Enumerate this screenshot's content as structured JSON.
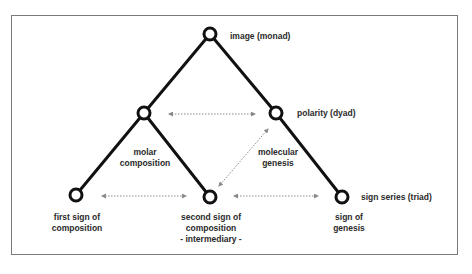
{
  "diagram": {
    "type": "tree",
    "nodes": [
      {
        "id": "image",
        "label": "image (monad)",
        "x": 210,
        "y": 34
      },
      {
        "id": "left_mid",
        "label": "",
        "x": 144,
        "y": 113
      },
      {
        "id": "polarity",
        "label": "polarity (dyad)",
        "x": 276,
        "y": 113
      },
      {
        "id": "first_sign",
        "label": "first sign of composition",
        "x": 76,
        "y": 195
      },
      {
        "id": "second_sign",
        "label": "second sign of composition - intermediary -",
        "x": 210,
        "y": 197
      },
      {
        "id": "sign_of_genesis",
        "label": "sign of genesis",
        "x": 342,
        "y": 197
      }
    ],
    "edges": [
      {
        "from": "image",
        "to": "left_mid"
      },
      {
        "from": "image",
        "to": "polarity"
      },
      {
        "from": "left_mid",
        "to": "first_sign"
      },
      {
        "from": "left_mid",
        "to": "second_sign"
      },
      {
        "from": "polarity",
        "to": "sign_of_genesis"
      }
    ],
    "relations": [
      {
        "from": "left_mid",
        "to": "polarity",
        "style": "dotted-double-arrow"
      },
      {
        "from": "first_sign",
        "to": "second_sign",
        "style": "dotted-double-arrow"
      },
      {
        "from": "second_sign",
        "to": "sign_of_genesis",
        "style": "dotted-double-arrow"
      },
      {
        "from": "second_sign",
        "to": "polarity",
        "style": "dotted-double-arrow"
      }
    ],
    "colors": {
      "edge": "#111111",
      "node_stroke": "#111111",
      "node_fill": "#ffffff",
      "relation_arrow": "#8a8a8a",
      "frame": "#7a7a7a",
      "text": "#2a2a2a"
    }
  },
  "labels": {
    "image": "image (monad)",
    "polarity": "polarity (dyad)",
    "sign_series": "sign series (triad)",
    "molar_composition": [
      "molar",
      "composition"
    ],
    "molecular_genesis": [
      "molecular",
      "genesis"
    ],
    "first_sign": [
      "first sign of",
      "composition"
    ],
    "second_sign": [
      "second sign of",
      "composition",
      "- intermediary -"
    ],
    "sign_of_genesis": [
      "sign of",
      "genesis"
    ]
  }
}
